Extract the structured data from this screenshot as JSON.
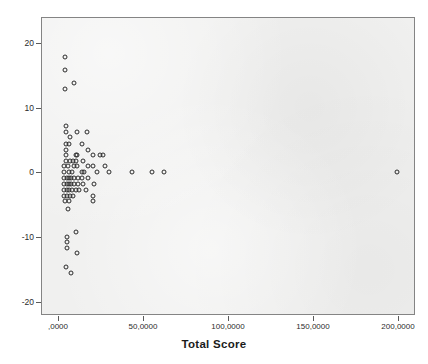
{
  "chart_data": {
    "type": "scatter",
    "title": "",
    "xlabel": "Total Score",
    "ylabel": "",
    "xlim": [
      -10,
      210
    ],
    "ylim": [
      -22,
      24
    ],
    "grid": false,
    "legend": null,
    "x_ticks": [
      {
        "value": 0,
        "label": ",0000"
      },
      {
        "value": 50,
        "label": "50,0000"
      },
      {
        "value": 100,
        "label": "100,0000"
      },
      {
        "value": 150,
        "label": "150,0000"
      },
      {
        "value": 200,
        "label": "200,0000"
      }
    ],
    "y_ticks": [
      {
        "value": 20,
        "label": "20"
      },
      {
        "value": 10,
        "label": "10"
      },
      {
        "value": 0,
        "label": "0"
      },
      {
        "value": -10,
        "label": "-10"
      },
      {
        "value": -20,
        "label": "-20"
      }
    ],
    "marker_style": "open-circle",
    "marker_color": "#2b2b2b",
    "plot_background": "#f0f0ef",
    "frame_color": "#848484",
    "points": [
      [
        3.7,
        18.0
      ],
      [
        3.7,
        15.9
      ],
      [
        9.1,
        13.9
      ],
      [
        3.7,
        13.0
      ],
      [
        4.3,
        7.4
      ],
      [
        4.3,
        6.4
      ],
      [
        10.4,
        6.4
      ],
      [
        16.5,
        6.4
      ],
      [
        6.7,
        5.6
      ],
      [
        4.3,
        4.6
      ],
      [
        6.1,
        4.6
      ],
      [
        13.4,
        4.6
      ],
      [
        4.3,
        3.7
      ],
      [
        17.1,
        3.7
      ],
      [
        4.3,
        2.8
      ],
      [
        9.8,
        2.8
      ],
      [
        10.4,
        2.8
      ],
      [
        20.1,
        2.8
      ],
      [
        24.4,
        2.8
      ],
      [
        25.6,
        2.8
      ],
      [
        4.3,
        2.0
      ],
      [
        6.7,
        2.0
      ],
      [
        8.5,
        2.0
      ],
      [
        9.8,
        2.0
      ],
      [
        14.0,
        2.0
      ],
      [
        3.0,
        1.1
      ],
      [
        5.5,
        1.1
      ],
      [
        9.1,
        1.1
      ],
      [
        10.4,
        1.1
      ],
      [
        17.1,
        1.1
      ],
      [
        20.1,
        1.1
      ],
      [
        26.8,
        1.1
      ],
      [
        3.0,
        0.2
      ],
      [
        6.1,
        0.2
      ],
      [
        7.9,
        0.2
      ],
      [
        13.4,
        0.2
      ],
      [
        14.6,
        0.2
      ],
      [
        22.6,
        0.2
      ],
      [
        29.3,
        0.2
      ],
      [
        42.7,
        0.2
      ],
      [
        54.9,
        0.2
      ],
      [
        61.6,
        0.2
      ],
      [
        199.0,
        0.2
      ],
      [
        3.0,
        -0.7
      ],
      [
        4.9,
        -0.7
      ],
      [
        6.1,
        -0.7
      ],
      [
        7.3,
        -0.7
      ],
      [
        9.1,
        -0.7
      ],
      [
        11.0,
        -0.7
      ],
      [
        13.4,
        -0.7
      ],
      [
        17.1,
        -0.7
      ],
      [
        3.0,
        -1.6
      ],
      [
        4.9,
        -1.6
      ],
      [
        6.1,
        -1.6
      ],
      [
        7.3,
        -1.6
      ],
      [
        9.1,
        -1.6
      ],
      [
        11.0,
        -1.6
      ],
      [
        14.0,
        -1.6
      ],
      [
        20.7,
        -1.6
      ],
      [
        3.0,
        -2.5
      ],
      [
        4.9,
        -2.5
      ],
      [
        6.1,
        -2.5
      ],
      [
        7.9,
        -2.5
      ],
      [
        9.8,
        -2.5
      ],
      [
        11.6,
        -2.5
      ],
      [
        15.9,
        -2.5
      ],
      [
        3.0,
        -3.4
      ],
      [
        4.9,
        -3.4
      ],
      [
        6.7,
        -3.4
      ],
      [
        8.5,
        -3.4
      ],
      [
        20.1,
        -3.4
      ],
      [
        3.7,
        -4.3
      ],
      [
        6.1,
        -4.3
      ],
      [
        20.1,
        -4.3
      ],
      [
        5.5,
        -5.5
      ],
      [
        9.8,
        -9.0
      ],
      [
        4.9,
        -9.8
      ],
      [
        4.9,
        -10.6
      ],
      [
        4.9,
        -11.5
      ],
      [
        10.4,
        -12.3
      ],
      [
        4.3,
        -14.5
      ],
      [
        7.3,
        -15.4
      ]
    ]
  },
  "axis": {
    "x_title": "Total Score"
  }
}
